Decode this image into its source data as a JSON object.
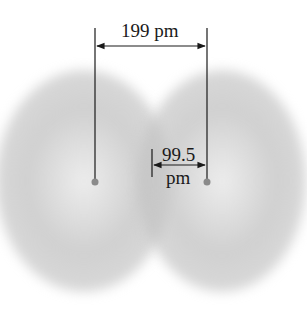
{
  "diagram": {
    "type": "bond-length-illustration",
    "bond_length_label": "199 pm",
    "radius_label_line1": "99.5",
    "radius_label_line2": "pm",
    "colors": {
      "cloud": "#c8c8c8",
      "line": "#1a1a1a",
      "nucleus": "#8a8a8a",
      "background": "#ffffff"
    }
  }
}
